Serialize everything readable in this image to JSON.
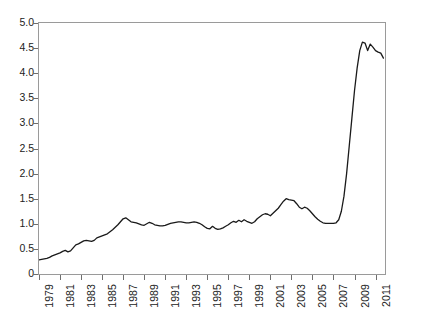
{
  "chart_data": {
    "type": "line",
    "title": "",
    "subtitle": "",
    "xlabel": "",
    "ylabel": "",
    "xlim": [
      1979,
      2011.9
    ],
    "ylim": [
      0,
      5.0
    ],
    "grid": false,
    "legend": null,
    "y_ticks": [
      0,
      0.5,
      1.0,
      1.5,
      2.0,
      2.5,
      3.0,
      3.5,
      4.0,
      4.5,
      5.0
    ],
    "y_tick_labels": [
      "0",
      "0.5",
      "1.0",
      "1.5",
      "2.0",
      "2.5",
      "3.0",
      "3.5",
      "4.0",
      "4.5",
      "5.0"
    ],
    "x_ticks": [
      1979,
      1981,
      1983,
      1985,
      1987,
      1989,
      1991,
      1993,
      1995,
      1997,
      1999,
      2001,
      2003,
      2005,
      2007,
      2009,
      2011
    ],
    "x_tick_labels": [
      "1979",
      "1981",
      "1983",
      "1985",
      "1987",
      "1989",
      "1991",
      "1993",
      "1995",
      "1997",
      "1999",
      "2001",
      "2003",
      "2005",
      "2007",
      "2009",
      "2011"
    ],
    "line_color": "#1a1a1a",
    "line_width": 1.3,
    "series": [
      {
        "name": "series-1",
        "x": [
          1979.0,
          1979.25,
          1979.5,
          1979.75,
          1980.0,
          1980.25,
          1980.5,
          1980.75,
          1981.0,
          1981.25,
          1981.5,
          1981.75,
          1982.0,
          1982.25,
          1982.5,
          1982.75,
          1983.0,
          1983.25,
          1983.5,
          1983.75,
          1984.0,
          1984.25,
          1984.5,
          1984.75,
          1985.0,
          1985.25,
          1985.5,
          1985.75,
          1986.0,
          1986.25,
          1986.5,
          1986.75,
          1987.0,
          1987.25,
          1987.5,
          1987.75,
          1988.0,
          1988.25,
          1988.5,
          1988.75,
          1989.0,
          1989.25,
          1989.5,
          1989.75,
          1990.0,
          1990.25,
          1990.5,
          1990.75,
          1991.0,
          1991.25,
          1991.5,
          1991.75,
          1992.0,
          1992.25,
          1992.5,
          1992.75,
          1993.0,
          1993.25,
          1993.5,
          1993.75,
          1994.0,
          1994.25,
          1994.5,
          1994.75,
          1995.0,
          1995.25,
          1995.5,
          1995.75,
          1996.0,
          1996.25,
          1996.5,
          1996.75,
          1997.0,
          1997.25,
          1997.5,
          1997.75,
          1998.0,
          1998.25,
          1998.5,
          1998.75,
          1999.0,
          1999.25,
          1999.5,
          1999.75,
          2000.0,
          2000.25,
          2000.5,
          2000.75,
          2001.0,
          2001.25,
          2001.5,
          2001.75,
          2002.0,
          2002.25,
          2002.5,
          2002.75,
          2003.0,
          2003.25,
          2003.5,
          2003.75,
          2004.0,
          2004.25,
          2004.5,
          2004.75,
          2005.0,
          2005.25,
          2005.5,
          2005.75,
          2006.0,
          2006.25,
          2006.5,
          2006.75,
          2007.0,
          2007.25,
          2007.5,
          2007.75,
          2008.0,
          2008.25,
          2008.5,
          2008.75,
          2009.0,
          2009.25,
          2009.5,
          2009.75,
          2010.0,
          2010.25,
          2010.5,
          2010.75,
          2011.0,
          2011.25,
          2011.5,
          2011.75
        ],
        "values": [
          0.28,
          0.29,
          0.3,
          0.31,
          0.33,
          0.36,
          0.38,
          0.4,
          0.42,
          0.45,
          0.47,
          0.44,
          0.46,
          0.52,
          0.58,
          0.6,
          0.63,
          0.66,
          0.67,
          0.66,
          0.65,
          0.67,
          0.72,
          0.74,
          0.76,
          0.78,
          0.8,
          0.84,
          0.88,
          0.93,
          0.98,
          1.04,
          1.1,
          1.12,
          1.08,
          1.04,
          1.03,
          1.02,
          1.0,
          0.98,
          0.97,
          1.0,
          1.03,
          1.01,
          0.98,
          0.97,
          0.96,
          0.96,
          0.97,
          0.99,
          1.01,
          1.02,
          1.03,
          1.04,
          1.04,
          1.03,
          1.02,
          1.02,
          1.03,
          1.04,
          1.03,
          1.01,
          0.98,
          0.94,
          0.91,
          0.9,
          0.95,
          0.91,
          0.89,
          0.9,
          0.92,
          0.95,
          0.98,
          1.02,
          1.05,
          1.03,
          1.07,
          1.04,
          1.08,
          1.05,
          1.03,
          1.01,
          1.04,
          1.1,
          1.14,
          1.18,
          1.2,
          1.19,
          1.16,
          1.21,
          1.26,
          1.31,
          1.38,
          1.45,
          1.5,
          1.48,
          1.47,
          1.46,
          1.4,
          1.33,
          1.3,
          1.33,
          1.31,
          1.26,
          1.2,
          1.14,
          1.09,
          1.05,
          1.02,
          1.01,
          1.01,
          1.01,
          1.01,
          1.02,
          1.08,
          1.25,
          1.55,
          2.0,
          2.55,
          3.1,
          3.65,
          4.1,
          4.45,
          4.62,
          4.6,
          4.45,
          4.58,
          4.52,
          4.45,
          4.42,
          4.4,
          4.3
        ]
      }
    ]
  }
}
